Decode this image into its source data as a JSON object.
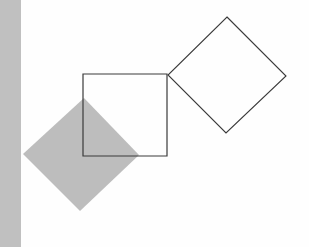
{
  "diagram": {
    "colors": {
      "background": "#ffffff",
      "side_bar": "#c0c0c0",
      "filled_diamond": "#bdbdbd",
      "outline": "#3a3a3a"
    },
    "shapes": {
      "side_bar": {
        "x": 0,
        "y": 0,
        "width": 21,
        "height": 247
      },
      "square": {
        "points": "83,74 167,74 167,156 83,156"
      },
      "outline_diamond": {
        "points": "227,17 286,76 226,133 168,75"
      },
      "filled_diamond": {
        "points": "84,98 139,155 80,211 23,154"
      }
    }
  }
}
